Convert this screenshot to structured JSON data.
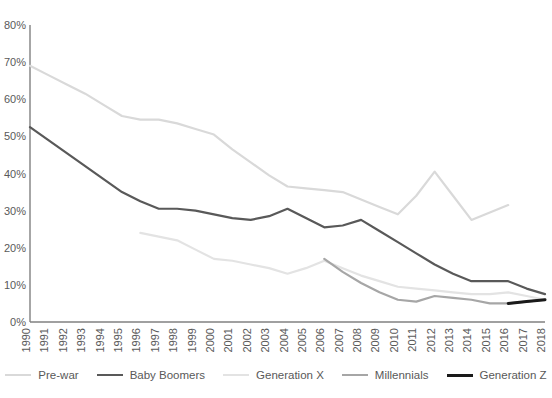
{
  "chart_data": {
    "type": "line",
    "title": "",
    "xlabel": "",
    "ylabel": "",
    "grid": false,
    "legend_position": "bottom",
    "x": [
      1990,
      1991,
      1992,
      1993,
      1994,
      1995,
      1996,
      1997,
      1998,
      1999,
      2000,
      2001,
      2002,
      2003,
      2004,
      2005,
      2006,
      2007,
      2008,
      2009,
      2010,
      2011,
      2012,
      2013,
      2014,
      2015,
      2016,
      2017,
      2018
    ],
    "xlim": [
      1990,
      2018
    ],
    "ylim": [
      0,
      80
    ],
    "ytick_labels": [
      "0%",
      "10%",
      "20%",
      "30%",
      "40%",
      "50%",
      "60%",
      "70%",
      "80%"
    ],
    "ytick_values": [
      0,
      10,
      20,
      30,
      40,
      50,
      60,
      70,
      80
    ],
    "xtick_labels": [
      "1990",
      "1991",
      "1992",
      "1993",
      "1994",
      "1995",
      "1996",
      "1997",
      "1998",
      "1999",
      "2000",
      "2001",
      "2002",
      "2003",
      "2004",
      "2005",
      "2006",
      "2007",
      "2008",
      "2009",
      "2010",
      "2011",
      "2012",
      "2013",
      "2014",
      "2015",
      "2016",
      "2017",
      "2018"
    ],
    "series": [
      {
        "name": "Pre-war",
        "color": "#d9d9d9",
        "x_start": 1990,
        "points": [
          {
            "x": 1990,
            "y": 69.0
          },
          {
            "x": 1991,
            "y": 66.5
          },
          {
            "x": 1992,
            "y": 64.0
          },
          {
            "x": 1993,
            "y": 61.5
          },
          {
            "x": 1994,
            "y": 58.5
          },
          {
            "x": 1995,
            "y": 55.5
          },
          {
            "x": 1996,
            "y": 54.5
          },
          {
            "x": 1997,
            "y": 54.5
          },
          {
            "x": 1998,
            "y": 53.5
          },
          {
            "x": 1999,
            "y": 52.0
          },
          {
            "x": 2000,
            "y": 50.5
          },
          {
            "x": 2001,
            "y": 46.5
          },
          {
            "x": 2002,
            "y": 43.0
          },
          {
            "x": 2003,
            "y": 39.5
          },
          {
            "x": 2004,
            "y": 36.5
          },
          {
            "x": 2005,
            "y": 36.0
          },
          {
            "x": 2006,
            "y": 35.5
          },
          {
            "x": 2007,
            "y": 35.0
          },
          {
            "x": 2008,
            "y": 33.0
          },
          {
            "x": 2009,
            "y": 31.0
          },
          {
            "x": 2010,
            "y": 29.0
          },
          {
            "x": 2011,
            "y": 34.0
          },
          {
            "x": 2012,
            "y": 40.5
          },
          {
            "x": 2013,
            "y": 34.0
          },
          {
            "x": 2014,
            "y": 27.5
          },
          {
            "x": 2015,
            "y": 29.5
          },
          {
            "x": 2016,
            "y": 31.5
          }
        ]
      },
      {
        "name": "Baby Boomers",
        "color": "#595959",
        "x_start": 1990,
        "points": [
          {
            "x": 1990,
            "y": 52.5
          },
          {
            "x": 1991,
            "y": 49.0
          },
          {
            "x": 1992,
            "y": 45.5
          },
          {
            "x": 1993,
            "y": 42.0
          },
          {
            "x": 1994,
            "y": 38.5
          },
          {
            "x": 1995,
            "y": 35.0
          },
          {
            "x": 1996,
            "y": 32.5
          },
          {
            "x": 1997,
            "y": 30.5
          },
          {
            "x": 1998,
            "y": 30.5
          },
          {
            "x": 1999,
            "y": 30.0
          },
          {
            "x": 2000,
            "y": 29.0
          },
          {
            "x": 2001,
            "y": 28.0
          },
          {
            "x": 2002,
            "y": 27.5
          },
          {
            "x": 2003,
            "y": 28.5
          },
          {
            "x": 2004,
            "y": 30.5
          },
          {
            "x": 2005,
            "y": 28.0
          },
          {
            "x": 2006,
            "y": 25.5
          },
          {
            "x": 2007,
            "y": 26.0
          },
          {
            "x": 2008,
            "y": 27.5
          },
          {
            "x": 2009,
            "y": 24.5
          },
          {
            "x": 2010,
            "y": 21.5
          },
          {
            "x": 2011,
            "y": 18.5
          },
          {
            "x": 2012,
            "y": 15.5
          },
          {
            "x": 2013,
            "y": 13.0
          },
          {
            "x": 2014,
            "y": 11.0
          },
          {
            "x": 2015,
            "y": 11.0
          },
          {
            "x": 2016,
            "y": 11.0
          },
          {
            "x": 2017,
            "y": 9.0
          },
          {
            "x": 2018,
            "y": 7.5
          }
        ]
      },
      {
        "name": "Generation X",
        "color": "#e3e3e3",
        "x_start": 1996,
        "points": [
          {
            "x": 1996,
            "y": 24.0
          },
          {
            "x": 1997,
            "y": 23.0
          },
          {
            "x": 1998,
            "y": 22.0
          },
          {
            "x": 1999,
            "y": 19.5
          },
          {
            "x": 2000,
            "y": 17.0
          },
          {
            "x": 2001,
            "y": 16.5
          },
          {
            "x": 2002,
            "y": 15.5
          },
          {
            "x": 2003,
            "y": 14.5
          },
          {
            "x": 2004,
            "y": 13.0
          },
          {
            "x": 2005,
            "y": 14.5
          },
          {
            "x": 2006,
            "y": 16.5
          },
          {
            "x": 2007,
            "y": 14.5
          },
          {
            "x": 2008,
            "y": 12.5
          },
          {
            "x": 2009,
            "y": 11.0
          },
          {
            "x": 2010,
            "y": 9.5
          },
          {
            "x": 2011,
            "y": 9.0
          },
          {
            "x": 2012,
            "y": 8.5
          },
          {
            "x": 2013,
            "y": 8.0
          },
          {
            "x": 2014,
            "y": 7.5
          },
          {
            "x": 2015,
            "y": 7.5
          },
          {
            "x": 2016,
            "y": 8.0
          },
          {
            "x": 2017,
            "y": 7.0
          },
          {
            "x": 2018,
            "y": 6.0
          }
        ]
      },
      {
        "name": "Millennials",
        "color": "#a6a6a6",
        "x_start": 2006,
        "points": [
          {
            "x": 2006,
            "y": 17.0
          },
          {
            "x": 2007,
            "y": 13.5
          },
          {
            "x": 2008,
            "y": 10.5
          },
          {
            "x": 2009,
            "y": 8.0
          },
          {
            "x": 2010,
            "y": 6.0
          },
          {
            "x": 2011,
            "y": 5.5
          },
          {
            "x": 2012,
            "y": 7.0
          },
          {
            "x": 2013,
            "y": 6.5
          },
          {
            "x": 2014,
            "y": 6.0
          },
          {
            "x": 2015,
            "y": 5.0
          },
          {
            "x": 2016,
            "y": 5.0
          },
          {
            "x": 2017,
            "y": 5.5
          },
          {
            "x": 2018,
            "y": 6.0
          }
        ]
      },
      {
        "name": "Generation Z",
        "color": "#1a1a1a",
        "x_start": 2016,
        "points": [
          {
            "x": 2016,
            "y": 5.0
          },
          {
            "x": 2017,
            "y": 5.5
          },
          {
            "x": 2018,
            "y": 6.0
          }
        ]
      }
    ]
  }
}
